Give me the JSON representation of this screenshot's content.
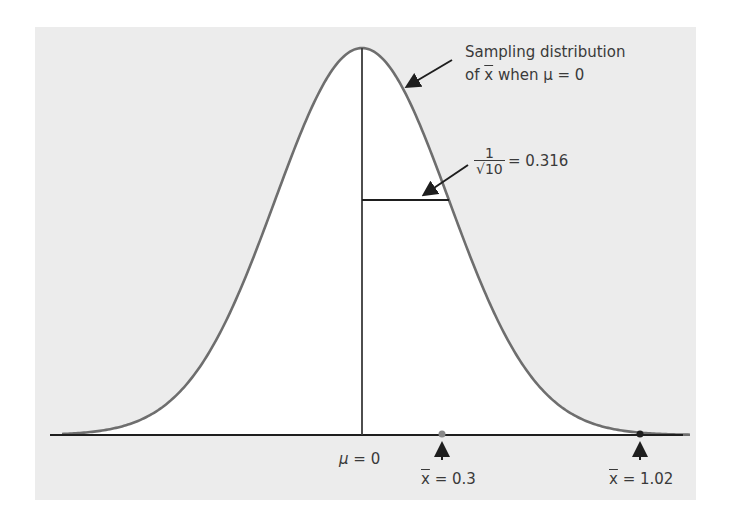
{
  "chart_data": {
    "type": "line",
    "title": "",
    "xlabel": "",
    "ylabel": "",
    "distribution": "normal",
    "mean": 0,
    "std_dev": 0.316,
    "x_range": [
      -1.17,
      1.2
    ],
    "grid": false,
    "legend": null,
    "annotations": [
      {
        "text": "Sampling distribution of x̄ when μ = 0",
        "points_to": "curve"
      },
      {
        "text": "1/√10 = 0.316",
        "points_to": "standard deviation segment"
      },
      {
        "text": "μ = 0",
        "x": 0
      },
      {
        "text": "x̄ = 0.3",
        "x": 0.3,
        "marker": "arrow"
      },
      {
        "text": "x̄ = 1.02",
        "x": 1.02,
        "marker": "arrow"
      }
    ],
    "colors": {
      "curve": "#6e6e6e",
      "axis": "#1e1e1e",
      "background": "#ececec",
      "fill": "#ffffff"
    }
  },
  "labels": {
    "curve_title_line1": "Sampling distribution",
    "curve_title_line2_prefix": "of ",
    "curve_title_xbar": "x",
    "curve_title_line2_suffix": " when μ = 0",
    "sd_numerator": "1",
    "sd_denominator": "√10",
    "sd_value": "= 0.316",
    "mu_label_sym": "μ",
    "mu_label_val": " = 0",
    "xbar1_sym": "x",
    "xbar1_val": " = 0.3",
    "xbar2_sym": "x",
    "xbar2_val": " = 1.02"
  }
}
